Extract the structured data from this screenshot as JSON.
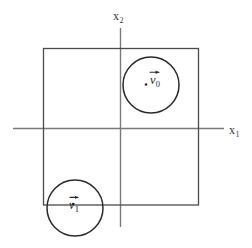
{
  "figure": {
    "title": "",
    "background_color": "#ffffff",
    "width": 252,
    "height": 248
  },
  "axes": {
    "x_axis": {
      "label": "x",
      "subscript": "1",
      "orientation": "horizontal",
      "color": "#7a7a7a",
      "start_x": 13,
      "end_x": 224,
      "y": 128
    },
    "y_axis": {
      "label": "x",
      "subscript": "2",
      "orientation": "vertical",
      "color": "#7a7a7a",
      "x": 120,
      "start_y": 28,
      "end_y": 227
    },
    "origin": {
      "x": 120,
      "y": 128
    }
  },
  "square": {
    "name": "bounding-square",
    "color": "#4c4c4c",
    "left": 43,
    "top": 48,
    "right": 199,
    "bottom": 205
  },
  "circles": [
    {
      "id": "v0",
      "label": "v",
      "subscript": "0",
      "has_vector_arrow": true,
      "center_x": 151,
      "center_y": 85,
      "radius": 28,
      "color": "#2b2b2b",
      "dot_x": 146,
      "dot_y": 84,
      "label_x": 150,
      "label_y": 78
    },
    {
      "id": "v1",
      "label": "v",
      "subscript": "1",
      "has_vector_arrow": true,
      "center_x": 75,
      "center_y": 208,
      "radius": 28,
      "color": "#2b2b2b",
      "dot_x": 73,
      "dot_y": 204,
      "label_x": 68,
      "label_y": 203
    }
  ]
}
